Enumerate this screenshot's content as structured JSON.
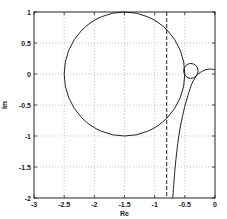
{
  "chart_data": {
    "type": "line",
    "title": "",
    "xlabel": "Re",
    "ylabel": "Im",
    "xlim": [
      -3,
      0
    ],
    "ylim": [
      -2,
      1
    ],
    "grid": true,
    "legend": null,
    "xticks": [
      -3,
      -2.5,
      -2,
      -1.5,
      -1,
      -0.5,
      0
    ],
    "xtick_labels": [
      "-3",
      "-2.5",
      "-2",
      "-1.5",
      "-1",
      "-0.5",
      "0"
    ],
    "yticks": [
      -2,
      -1.5,
      -1,
      -0.5,
      0,
      0.5,
      1
    ],
    "ytick_labels": [
      "-2",
      "-1.5",
      "-1",
      "-0.5",
      "0",
      "0.5",
      "1"
    ],
    "series": [
      {
        "name": "large-circle",
        "shape": "circle",
        "center": [
          -1.5,
          0
        ],
        "radius": 1.0,
        "style": "solid"
      },
      {
        "name": "small-circle",
        "shape": "circle",
        "center": [
          -0.4,
          0.05
        ],
        "radius": 0.12,
        "style": "solid"
      },
      {
        "name": "vertical-dashed-line",
        "shape": "vline",
        "x": -0.8,
        "style": "dashed"
      },
      {
        "name": "curve",
        "shape": "curve",
        "style": "solid",
        "x": [
          -0.7,
          -0.66,
          -0.6,
          -0.52,
          -0.45,
          -0.38,
          -0.3,
          -0.2,
          -0.1,
          0
        ],
        "y": [
          -2,
          -1.5,
          -1.0,
          -0.6,
          -0.35,
          -0.15,
          -0.02,
          0.05,
          0.08,
          0.07
        ]
      }
    ]
  }
}
